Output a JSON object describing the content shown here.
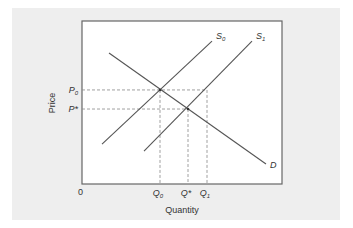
{
  "chart_data": {
    "type": "line",
    "title": "",
    "xlabel": "Quantity",
    "ylabel": "Price",
    "origin_label": "0",
    "xlim": [
      0,
      10
    ],
    "ylim": [
      0,
      10
    ],
    "grid": false,
    "series": [
      {
        "name": "D",
        "label": "D",
        "points": [
          [
            1.35,
            8.04
          ],
          [
            9.2,
            1.23
          ]
        ]
      },
      {
        "name": "S0",
        "label": "S",
        "sub": "0",
        "points": [
          [
            1.0,
            2.45
          ],
          [
            6.5,
            8.77
          ]
        ]
      },
      {
        "name": "S1",
        "label": "S",
        "sub": "1",
        "points": [
          [
            3.1,
            2.02
          ],
          [
            8.5,
            8.77
          ]
        ]
      }
    ],
    "y_ticks": [
      {
        "label": "P",
        "sub": "0",
        "value": 5.77,
        "dash_to_x": 6.25
      },
      {
        "label": "P*",
        "sub": "",
        "value": 4.6,
        "dash_to_x": 5.3
      }
    ],
    "x_ticks": [
      {
        "label": "Q",
        "sub": "0",
        "value": 3.9,
        "dash_to_y": 5.77
      },
      {
        "label": "Q*",
        "sub": "",
        "value": 5.3,
        "dash_to_y": 4.6
      },
      {
        "label": "Q",
        "sub": "1",
        "value": 6.25,
        "dash_to_y": 5.77
      }
    ],
    "equilibria": [
      [
        3.9,
        5.77
      ],
      [
        5.3,
        4.6
      ]
    ],
    "legend": "none"
  }
}
